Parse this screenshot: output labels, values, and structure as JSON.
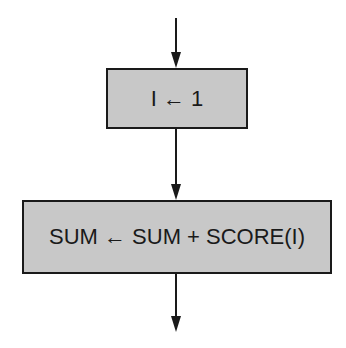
{
  "diagram": {
    "type": "flowchart",
    "nodes": [
      {
        "id": "init",
        "label": "I ← 1",
        "shape": "process"
      },
      {
        "id": "accumulate",
        "label": "SUM ← SUM + SCORE(I)",
        "shape": "process"
      }
    ],
    "edges": [
      {
        "from": "entry",
        "to": "init"
      },
      {
        "from": "init",
        "to": "accumulate"
      },
      {
        "from": "accumulate",
        "to": "exit"
      }
    ],
    "colors": {
      "box_fill": "#c8c8c8",
      "stroke": "#1a1a1a",
      "background": "#ffffff"
    }
  }
}
